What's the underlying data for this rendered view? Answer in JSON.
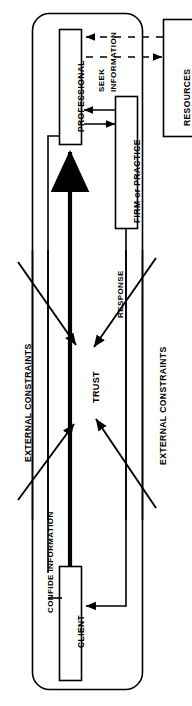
{
  "diagram": {
    "orientation": "rotated-90",
    "container": {
      "name": "professional-service-boundary",
      "shape": "rounded-rectangle"
    },
    "nodes": [
      {
        "id": "professional",
        "label": "PROFESSIONAL",
        "shape": "rectangle"
      },
      {
        "id": "firm_practice",
        "label": "FIRM or PRACTICE",
        "shape": "rectangle"
      },
      {
        "id": "client",
        "label": "CLIENT",
        "shape": "rectangle"
      },
      {
        "id": "resources",
        "label": "RESOURCES",
        "shape": "rectangle"
      }
    ],
    "flow_labels": [
      {
        "id": "seek_information",
        "line1": "SEEK",
        "line2": "INFORMATION"
      },
      {
        "id": "confide_information",
        "text": "CONFIDE INFORMATION"
      },
      {
        "id": "response",
        "text": "RESPONSE"
      },
      {
        "id": "trust",
        "text": "TRUST"
      }
    ],
    "constraints": [
      {
        "id": "external-constraints-left",
        "text": "EXTERNAL CONSTRAINTS"
      },
      {
        "id": "external-constraints-right",
        "text": "EXTERNAL CONSTRAINTS"
      }
    ],
    "colors": {
      "stroke": "#000000",
      "fill": "#ffffff",
      "background": "#ffffff"
    }
  }
}
